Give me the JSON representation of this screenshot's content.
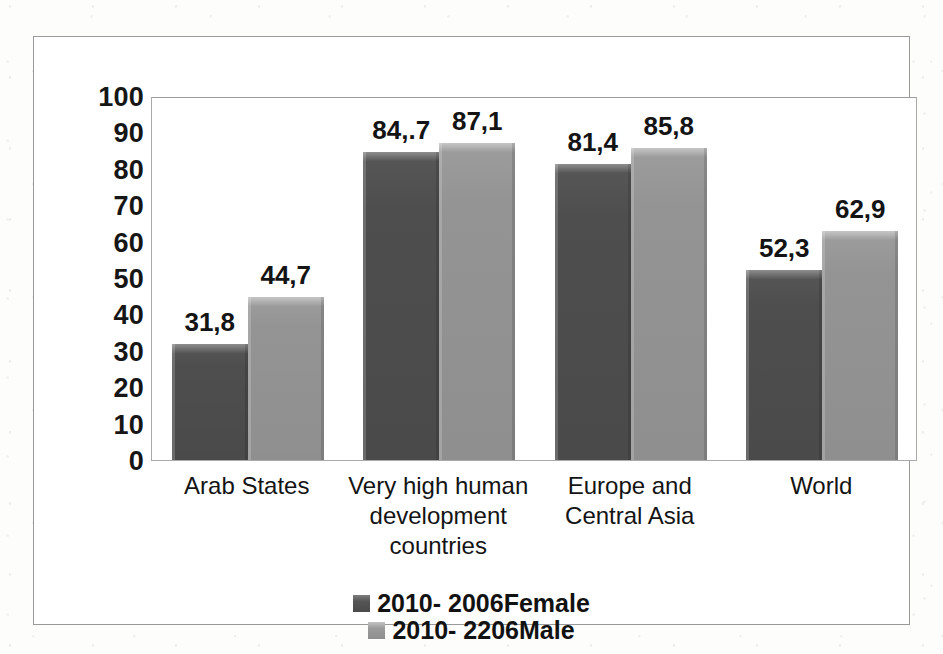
{
  "chart_data": {
    "type": "bar",
    "title": "",
    "xlabel": "",
    "ylabel": "",
    "ylim": [
      0,
      100
    ],
    "grid": false,
    "legend_position": "bottom",
    "categories": [
      "Arab States",
      "Very high human development countries",
      "Europe and Central Asia",
      "World"
    ],
    "category_lines": [
      [
        "Arab States"
      ],
      [
        "Very high human",
        "development",
        "countries"
      ],
      [
        "Europe and",
        "Central Asia"
      ],
      [
        "World"
      ]
    ],
    "yticks": [
      "100",
      "90",
      "80",
      "70",
      "60",
      "50",
      "40",
      "30",
      "20",
      "10",
      "0"
    ],
    "ytick_values": [
      100,
      90,
      80,
      70,
      60,
      50,
      40,
      30,
      20,
      10,
      0
    ],
    "series": [
      {
        "name": "2010- 2006Female",
        "color": "#4a4a4a",
        "values": [
          31.8,
          84.7,
          81.4,
          52.3
        ],
        "labels": [
          "31,8",
          "84,.7",
          "81,4",
          "52,3"
        ]
      },
      {
        "name": "2010- 2206Male",
        "color": "#8f8f8f",
        "values": [
          44.7,
          87.1,
          85.8,
          62.9
        ],
        "labels": [
          "44,7",
          "87,1",
          "85,8",
          "62,9"
        ]
      }
    ]
  },
  "legend": {
    "items": [
      {
        "label": "2010- 2006Female",
        "swatch": "female-swatch"
      },
      {
        "label": "2010- 2206Male",
        "swatch": "male-swatch"
      }
    ]
  }
}
